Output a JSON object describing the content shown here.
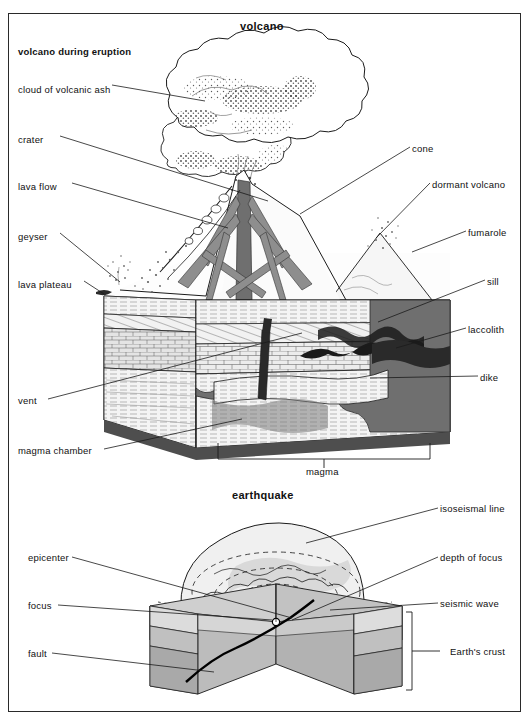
{
  "page": {
    "width": 532,
    "height": 721,
    "background": "#ffffff",
    "frame_color": "#2a2a2a",
    "ink_color": "#111111"
  },
  "sections": [
    {
      "id": "volcano",
      "title": "volcano",
      "subtitle": "volcano during eruption",
      "labels_left": [
        {
          "key": "cloud-of-volcanic-ash",
          "text": "cloud of volcanic ash",
          "x": 18,
          "y": 84,
          "leader_to": [
            205,
            101
          ]
        },
        {
          "key": "crater",
          "text": "crater",
          "x": 18,
          "y": 134,
          "leader_to": [
            268,
            201
          ]
        },
        {
          "key": "lava-flow",
          "text": "lava flow",
          "x": 18,
          "y": 181,
          "leader_to": [
            228,
            228
          ]
        },
        {
          "key": "geyser",
          "text": "geyser",
          "x": 18,
          "y": 231,
          "leader_to": [
            121,
            285
          ]
        },
        {
          "key": "lava-plateau",
          "text": "lava plateau",
          "x": 18,
          "y": 279,
          "leader_to": [
            104,
            296
          ]
        },
        {
          "key": "vent",
          "text": "vent",
          "x": 18,
          "y": 398,
          "leader_to": [
            300,
            333
          ]
        },
        {
          "key": "magma-chamber",
          "text": "magma chamber",
          "x": 18,
          "y": 447,
          "leader_to": [
            240,
            420
          ]
        }
      ],
      "labels_right": [
        {
          "key": "cone",
          "text": "cone",
          "x": 412,
          "y": 145,
          "leader_to": [
            300,
            215
          ]
        },
        {
          "key": "dormant-volcano",
          "text": "dormant volcano",
          "x": 432,
          "y": 181,
          "leader_to": [
            376,
            240
          ]
        },
        {
          "key": "fumarole",
          "text": "fumarole",
          "x": 468,
          "y": 229,
          "leader_to": [
            415,
            252
          ]
        },
        {
          "key": "sill",
          "text": "sill",
          "x": 487,
          "y": 278,
          "leader_to": [
            380,
            320
          ]
        },
        {
          "key": "laccolith",
          "text": "laccolith",
          "x": 468,
          "y": 326,
          "leader_to": [
            400,
            346
          ]
        },
        {
          "key": "dike",
          "text": "dike",
          "x": 480,
          "y": 374,
          "leader_to": [
            372,
            378
          ]
        }
      ],
      "labels_bottom": [
        {
          "key": "magma",
          "text": "magma",
          "x": 306,
          "y": 466,
          "bracket": {
            "x1": 218,
            "x2": 430,
            "y": 443,
            "drop": 16
          }
        }
      ]
    },
    {
      "id": "earthquake",
      "title": "earthquake",
      "labels_left": [
        {
          "key": "epicenter",
          "text": "epicenter",
          "x": 28,
          "y": 555,
          "leader_to": [
            292,
            618
          ]
        },
        {
          "key": "focus",
          "text": "focus",
          "x": 28,
          "y": 603,
          "leader_to": [
            286,
            624
          ]
        },
        {
          "key": "fault",
          "text": "fault",
          "x": 28,
          "y": 651,
          "leader_to": [
            214,
            672
          ]
        }
      ],
      "labels_right": [
        {
          "key": "isoseismal-line",
          "text": "isoseismal line",
          "x": 440,
          "y": 506,
          "leader_to": [
            306,
            543
          ]
        },
        {
          "key": "depth-of-focus",
          "text": "depth of focus",
          "x": 440,
          "y": 555,
          "leader_to": [
            296,
            622
          ]
        },
        {
          "key": "seismic-wave",
          "text": "seismic wave",
          "x": 440,
          "y": 601,
          "leader_to": [
            331,
            612
          ]
        },
        {
          "key": "earths-crust",
          "text": "Earth's crust",
          "x": 450,
          "y": 650,
          "leader_to": [
            410,
            650
          ]
        }
      ]
    }
  ],
  "palette": {
    "rock_light": "#e9e9e9",
    "rock_mid": "#c9c9c9",
    "rock_dark": "#a8a8a8",
    "magma_gray": "#6e6e6e",
    "lava_gray": "#8b8b8b",
    "outline": "#1b1b1b",
    "dashed": "#222222",
    "sea_tint": "#d8d8d8"
  }
}
